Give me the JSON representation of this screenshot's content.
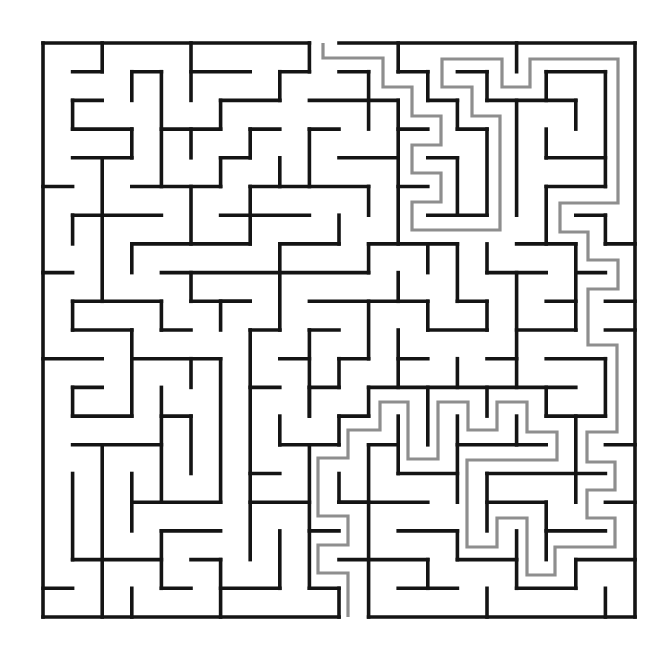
{
  "puzzle": {
    "type": "maze",
    "label": "Maze with highlighted solution path",
    "colors": {
      "background": "#ffffff",
      "wall": "#141414",
      "solution": "#8e8e8e"
    },
    "grid": {
      "cols": 20,
      "rows": 20,
      "x0": 43,
      "y0": 43,
      "cell_w": 29.6,
      "cell_h": 28.7
    },
    "entrance": {
      "side": "top",
      "col": 9
    },
    "exit": {
      "side": "bottom",
      "col": 10
    },
    "border": [
      [
        "H",
        0,
        0,
        9
      ],
      [
        "H",
        0,
        10,
        20
      ],
      [
        "H",
        20,
        0,
        10
      ],
      [
        "H",
        20,
        11,
        20
      ],
      [
        "V",
        0,
        0,
        20
      ],
      [
        "V",
        20,
        0,
        20
      ]
    ],
    "walls": [
      [
        "H",
        1,
        1,
        2
      ],
      [
        "V",
        2,
        0,
        1
      ],
      [
        "V",
        3,
        1,
        2
      ],
      [
        "H",
        1,
        3,
        4
      ],
      [
        "V",
        4,
        1,
        5
      ],
      [
        "V",
        5,
        0,
        2
      ],
      [
        "H",
        1,
        5,
        7
      ],
      [
        "H",
        2,
        1,
        2
      ],
      [
        "V",
        1,
        2,
        3
      ],
      [
        "H",
        3,
        1,
        3
      ],
      [
        "V",
        3,
        3,
        4
      ],
      [
        "H",
        4,
        1,
        3
      ],
      [
        "V",
        2,
        4,
        9
      ],
      [
        "H",
        3,
        4,
        6
      ],
      [
        "V",
        6,
        2,
        3
      ],
      [
        "H",
        2,
        6,
        8
      ],
      [
        "V",
        5,
        3,
        4
      ],
      [
        "H",
        5,
        3,
        6
      ],
      [
        "V",
        6,
        4,
        5
      ],
      [
        "H",
        4,
        6,
        7
      ],
      [
        "H",
        5,
        0,
        1
      ],
      [
        "V",
        5,
        5,
        7
      ],
      [
        "H",
        6,
        1,
        4
      ],
      [
        "V",
        1,
        6,
        7
      ],
      [
        "H",
        6,
        6,
        9
      ],
      [
        "V",
        9,
        0,
        1
      ],
      [
        "H",
        1,
        8,
        9
      ],
      [
        "V",
        8,
        1,
        2
      ],
      [
        "H",
        3,
        7,
        8
      ],
      [
        "V",
        7,
        3,
        4
      ],
      [
        "V",
        8,
        4,
        5
      ],
      [
        "H",
        5,
        7,
        11
      ],
      [
        "V",
        11,
        5,
        6
      ],
      [
        "V",
        9,
        3,
        5
      ],
      [
        "H",
        3,
        9,
        10
      ],
      [
        "V",
        7,
        5,
        7
      ],
      [
        "V",
        10,
        6,
        7
      ],
      [
        "H",
        7,
        8,
        10
      ],
      [
        "H",
        7,
        3,
        7
      ],
      [
        "H",
        1,
        10,
        11
      ],
      [
        "V",
        11,
        1,
        3
      ],
      [
        "H",
        2,
        9,
        12
      ],
      [
        "V",
        12,
        2,
        7
      ],
      [
        "V",
        12,
        0,
        1
      ],
      [
        "H",
        1,
        12,
        13
      ],
      [
        "V",
        13,
        1,
        2
      ],
      [
        "H",
        2,
        13,
        14
      ],
      [
        "V",
        14,
        2,
        3
      ],
      [
        "H",
        3,
        14,
        15
      ],
      [
        "V",
        15,
        3,
        6
      ],
      [
        "H",
        6,
        13,
        15
      ],
      [
        "H",
        3,
        12,
        13
      ],
      [
        "H",
        4,
        10,
        12
      ],
      [
        "H",
        5,
        12,
        13
      ],
      [
        "H",
        4,
        13,
        14
      ],
      [
        "V",
        14,
        4,
        6
      ],
      [
        "V",
        16,
        0,
        1
      ],
      [
        "H",
        1,
        14,
        15
      ],
      [
        "V",
        15,
        1,
        2
      ],
      [
        "H",
        2,
        15,
        18
      ],
      [
        "V",
        18,
        2,
        3
      ],
      [
        "V",
        16,
        2,
        6
      ],
      [
        "H",
        1,
        17,
        19
      ],
      [
        "V",
        17,
        1,
        2
      ],
      [
        "V",
        19,
        1,
        5
      ],
      [
        "H",
        4,
        17,
        19
      ],
      [
        "V",
        17,
        3,
        4
      ],
      [
        "H",
        5,
        17,
        19
      ],
      [
        "V",
        17,
        5,
        7
      ],
      [
        "H",
        6,
        18,
        19
      ],
      [
        "V",
        19,
        6,
        7
      ],
      [
        "H",
        7,
        19,
        20
      ],
      [
        "H",
        7,
        16,
        18
      ],
      [
        "H",
        7,
        11,
        14
      ],
      [
        "V",
        13,
        7,
        8
      ],
      [
        "V",
        14,
        7,
        9
      ],
      [
        "H",
        9,
        14,
        15
      ],
      [
        "V",
        15,
        9,
        10
      ],
      [
        "H",
        10,
        13,
        15
      ],
      [
        "V",
        13,
        9,
        10
      ],
      [
        "V",
        15,
        7,
        8
      ],
      [
        "H",
        8,
        15,
        17
      ],
      [
        "V",
        18,
        7,
        10
      ],
      [
        "H",
        10,
        16,
        18
      ],
      [
        "V",
        16,
        8,
        12
      ],
      [
        "H",
        8,
        18,
        19
      ],
      [
        "H",
        9,
        17,
        18
      ],
      [
        "H",
        9,
        19,
        20
      ],
      [
        "H",
        10,
        19,
        20
      ],
      [
        "H",
        11,
        12,
        13
      ],
      [
        "V",
        14,
        11,
        12
      ],
      [
        "H",
        11,
        15,
        16
      ],
      [
        "H",
        12,
        11,
        18
      ],
      [
        "H",
        11,
        17,
        19
      ],
      [
        "V",
        19,
        11,
        13
      ],
      [
        "H",
        13,
        17,
        19
      ],
      [
        "V",
        17,
        12,
        13
      ],
      [
        "V",
        15,
        12,
        13
      ],
      [
        "V",
        8,
        7,
        10
      ],
      [
        "H",
        8,
        4,
        11
      ],
      [
        "V",
        11,
        7,
        8
      ],
      [
        "H",
        9,
        6,
        7
      ],
      [
        "H",
        9,
        9,
        13
      ],
      [
        "V",
        12,
        8,
        9
      ],
      [
        "H",
        10,
        7,
        8
      ],
      [
        "V",
        11,
        9,
        11
      ],
      [
        "H",
        11,
        10,
        11
      ],
      [
        "V",
        10,
        11,
        12
      ],
      [
        "H",
        12,
        9,
        10
      ],
      [
        "H",
        10,
        9,
        10
      ],
      [
        "V",
        9,
        10,
        13
      ],
      [
        "H",
        11,
        8,
        9
      ],
      [
        "H",
        12,
        7,
        8
      ],
      [
        "V",
        12,
        10,
        12
      ],
      [
        "V",
        11,
        12,
        13
      ],
      [
        "H",
        13,
        10,
        11
      ],
      [
        "V",
        13,
        12,
        14
      ],
      [
        "V",
        8,
        13,
        14
      ],
      [
        "H",
        8,
        0,
        1
      ],
      [
        "V",
        3,
        7,
        8
      ],
      [
        "V",
        5,
        8,
        9
      ],
      [
        "H",
        9,
        5,
        7
      ],
      [
        "V",
        6,
        9,
        10
      ],
      [
        "H",
        9,
        1,
        4
      ],
      [
        "V",
        1,
        9,
        10
      ],
      [
        "H",
        10,
        1,
        3
      ],
      [
        "V",
        3,
        10,
        13
      ],
      [
        "V",
        4,
        9,
        10
      ],
      [
        "H",
        10,
        4,
        5
      ],
      [
        "H",
        11,
        0,
        2
      ],
      [
        "H",
        11,
        3,
        6
      ],
      [
        "V",
        5,
        11,
        12
      ],
      [
        "V",
        6,
        11,
        16
      ],
      [
        "H",
        12,
        1,
        2
      ],
      [
        "V",
        1,
        12,
        13
      ],
      [
        "V",
        4,
        12,
        16
      ],
      [
        "V",
        7,
        10,
        18
      ],
      [
        "H",
        13,
        4,
        5
      ],
      [
        "V",
        5,
        13,
        15
      ],
      [
        "H",
        13,
        1,
        3
      ],
      [
        "H",
        16,
        3,
        6
      ],
      [
        "V",
        3,
        15,
        17
      ],
      [
        "H",
        14,
        1,
        4
      ],
      [
        "V",
        2,
        14,
        20
      ],
      [
        "V",
        1,
        15,
        18
      ],
      [
        "H",
        18,
        1,
        4
      ],
      [
        "V",
        4,
        17,
        19
      ],
      [
        "H",
        17,
        4,
        6
      ],
      [
        "H",
        19,
        4,
        5
      ],
      [
        "H",
        18,
        5,
        6
      ],
      [
        "V",
        6,
        18,
        20
      ],
      [
        "H",
        19,
        0,
        1
      ],
      [
        "V",
        3,
        19,
        20
      ],
      [
        "H",
        19,
        6,
        8
      ],
      [
        "V",
        9,
        12,
        13
      ],
      [
        "V",
        10,
        13,
        14
      ],
      [
        "H",
        14,
        8,
        10
      ],
      [
        "V",
        9,
        14,
        19
      ],
      [
        "H",
        19,
        9,
        10
      ],
      [
        "V",
        10,
        19,
        20
      ],
      [
        "H",
        15,
        7,
        8
      ],
      [
        "H",
        16,
        7,
        9
      ],
      [
        "H",
        17,
        9,
        10
      ],
      [
        "V",
        8,
        17,
        19
      ],
      [
        "V",
        11,
        14,
        20
      ],
      [
        "H",
        14,
        11,
        12
      ],
      [
        "H",
        16,
        10,
        11
      ],
      [
        "V",
        10,
        15,
        16
      ],
      [
        "V",
        12,
        13,
        15
      ],
      [
        "H",
        15,
        12,
        14
      ],
      [
        "V",
        14,
        13,
        16
      ],
      [
        "H",
        14,
        14,
        17
      ],
      [
        "V",
        16,
        13,
        14
      ],
      [
        "V",
        18,
        13,
        16
      ],
      [
        "H",
        15,
        15,
        19
      ],
      [
        "V",
        15,
        15,
        17
      ],
      [
        "H",
        16,
        15,
        17
      ],
      [
        "V",
        17,
        16,
        18
      ],
      [
        "H",
        17,
        17,
        19
      ],
      [
        "H",
        14,
        19,
        20
      ],
      [
        "H",
        16,
        19,
        20
      ],
      [
        "H",
        16,
        10,
        13
      ],
      [
        "H",
        17,
        12,
        14
      ],
      [
        "V",
        14,
        17,
        18
      ],
      [
        "H",
        18,
        14,
        16
      ],
      [
        "V",
        16,
        17,
        19
      ],
      [
        "H",
        19,
        16,
        18
      ],
      [
        "V",
        18,
        18,
        19
      ],
      [
        "H",
        18,
        18,
        20
      ],
      [
        "H",
        18,
        10,
        13
      ],
      [
        "V",
        13,
        18,
        19
      ],
      [
        "H",
        19,
        12,
        14
      ],
      [
        "V",
        15,
        19,
        20
      ],
      [
        "V",
        19,
        19,
        20
      ]
    ],
    "solution_path": [
      [
        323,
        43
      ],
      [
        323,
        58
      ],
      [
        383,
        58
      ],
      [
        383,
        87
      ],
      [
        412,
        87
      ],
      [
        412,
        116
      ],
      [
        441,
        116
      ],
      [
        441,
        145
      ],
      [
        412,
        145
      ],
      [
        412,
        173
      ],
      [
        441,
        173
      ],
      [
        441,
        202
      ],
      [
        412,
        202
      ],
      [
        412,
        230
      ],
      [
        500,
        230
      ],
      [
        500,
        116
      ],
      [
        472,
        116
      ],
      [
        472,
        87
      ],
      [
        442,
        87
      ],
      [
        442,
        59
      ],
      [
        502,
        59
      ],
      [
        502,
        87
      ],
      [
        530,
        87
      ],
      [
        530,
        59
      ],
      [
        618,
        59
      ],
      [
        618,
        203
      ],
      [
        560,
        203
      ],
      [
        560,
        232
      ],
      [
        588,
        232
      ],
      [
        588,
        260
      ],
      [
        618,
        260
      ],
      [
        618,
        289
      ],
      [
        588,
        289
      ],
      [
        588,
        345
      ],
      [
        617,
        345
      ],
      [
        617,
        432
      ],
      [
        587,
        432
      ],
      [
        587,
        462
      ],
      [
        615,
        462
      ],
      [
        615,
        490
      ],
      [
        587,
        490
      ],
      [
        587,
        518
      ],
      [
        615,
        518
      ],
      [
        615,
        547
      ],
      [
        555,
        547
      ],
      [
        555,
        575
      ],
      [
        527,
        575
      ],
      [
        527,
        518
      ],
      [
        497,
        518
      ],
      [
        497,
        547
      ],
      [
        467,
        547
      ],
      [
        467,
        460
      ],
      [
        557,
        460
      ],
      [
        557,
        432
      ],
      [
        527,
        432
      ],
      [
        527,
        402
      ],
      [
        497,
        402
      ],
      [
        497,
        430
      ],
      [
        468,
        430
      ],
      [
        468,
        402
      ],
      [
        438,
        402
      ],
      [
        438,
        459
      ],
      [
        408,
        459
      ],
      [
        408,
        402
      ],
      [
        380,
        402
      ],
      [
        380,
        430
      ],
      [
        348,
        430
      ],
      [
        348,
        458
      ],
      [
        318,
        458
      ],
      [
        318,
        516
      ],
      [
        348,
        516
      ],
      [
        348,
        545
      ],
      [
        318,
        545
      ],
      [
        318,
        573
      ],
      [
        348,
        573
      ],
      [
        348,
        617
      ]
    ]
  }
}
